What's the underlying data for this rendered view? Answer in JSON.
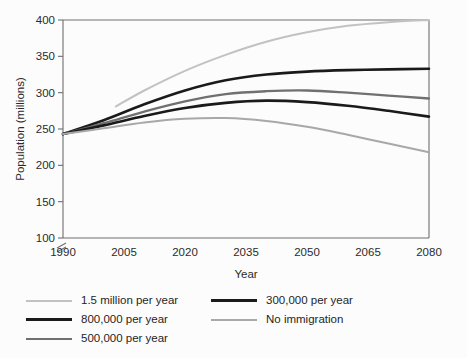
{
  "chart_data": {
    "type": "line",
    "title": "",
    "xlabel": "Year",
    "ylabel": "Population (millions)",
    "xlim": [
      1990,
      2080
    ],
    "ylim": [
      100,
      400
    ],
    "y_axis_break": true,
    "grid": false,
    "legend_position": "below",
    "x_ticks": [
      "1990",
      "2005",
      "2020",
      "2035",
      "2050",
      "2065",
      "2080"
    ],
    "x_tick_values": [
      1990,
      2005,
      2020,
      2035,
      2050,
      2065,
      2080
    ],
    "y_ticks": [
      "100",
      "150",
      "200",
      "250",
      "300",
      "350",
      "400"
    ],
    "y_tick_values": [
      100,
      150,
      200,
      250,
      300,
      350,
      400
    ],
    "x": [
      1990,
      2000,
      2010,
      2020,
      2030,
      2040,
      2050,
      2060,
      2070,
      2080
    ],
    "series": [
      {
        "name": "1.5 million per year",
        "color": "#c2c2c2",
        "width": 2.0,
        "x": [
          2003,
          2010,
          2020,
          2030,
          2040,
          2050,
          2060,
          2070,
          2080
        ],
        "values": [
          281,
          303,
          330,
          352,
          370,
          383,
          392,
          397,
          400
        ]
      },
      {
        "name": "800,000 per year",
        "color": "#1a1a1a",
        "width": 2.6,
        "x": [
          1990,
          2000,
          2010,
          2020,
          2030,
          2040,
          2050,
          2060,
          2070,
          2080
        ],
        "values": [
          243,
          262,
          284,
          303,
          317,
          325,
          329,
          331,
          332,
          333
        ]
      },
      {
        "name": "500,000 per year",
        "color": "#707070",
        "width": 2.3,
        "x": [
          1990,
          2000,
          2010,
          2020,
          2030,
          2040,
          2050,
          2060,
          2070,
          2080
        ],
        "values": [
          243,
          258,
          274,
          288,
          298,
          302,
          303,
          300,
          296,
          292
        ]
      },
      {
        "name": "300,000 per year",
        "color": "#1a1a1a",
        "width": 2.6,
        "x": [
          1990,
          2000,
          2010,
          2020,
          2030,
          2040,
          2050,
          2060,
          2070,
          2080
        ],
        "values": [
          243,
          255,
          268,
          279,
          286,
          289,
          287,
          282,
          275,
          267
        ]
      },
      {
        "name": "No immigration",
        "color": "#a8a8a8",
        "width": 2.0,
        "x": [
          1990,
          2000,
          2010,
          2020,
          2030,
          2040,
          2050,
          2060,
          2070,
          2080
        ],
        "values": [
          243,
          251,
          259,
          264,
          265,
          261,
          253,
          242,
          230,
          218
        ]
      }
    ]
  },
  "axes": {
    "x_title": "Year",
    "y_title": "Population (millions)",
    "x_tick_labels": [
      "1990",
      "2005",
      "2020",
      "2035",
      "2050",
      "2065",
      "2080"
    ],
    "y_tick_labels": [
      "100",
      "150",
      "200",
      "250",
      "300",
      "350",
      "400"
    ]
  },
  "legend": {
    "column_left": [
      {
        "label": "1.5 million per year",
        "color": "#c2c2c2",
        "width": "2px"
      },
      {
        "label": "800,000 per year",
        "color": "#1a1a1a",
        "width": "3px"
      },
      {
        "label": "500,000 per year",
        "color": "#707070",
        "width": "2.5px"
      }
    ],
    "column_right": [
      {
        "label": "300,000 per year",
        "color": "#1a1a1a",
        "width": "3px"
      },
      {
        "label": "No immigration",
        "color": "#a8a8a8",
        "width": "2px"
      }
    ]
  }
}
